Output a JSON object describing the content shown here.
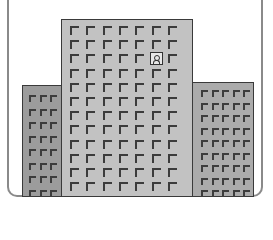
{
  "illustration": {
    "subject": "office-buildings",
    "colors": {
      "center_building": "#c2c2c2",
      "left_building": "#9c9c9c",
      "right_building": "#ababab",
      "outline": "#3a3a3a",
      "frame": "#8a8a8a"
    },
    "center_building": {
      "columns": 7,
      "rows": 12,
      "special_window": {
        "row": 2,
        "col": 5,
        "icon": "person-icon"
      }
    },
    "left_building": {
      "columns": 3,
      "rows": 8
    },
    "right_building": {
      "columns": 5,
      "rows": 9
    }
  }
}
